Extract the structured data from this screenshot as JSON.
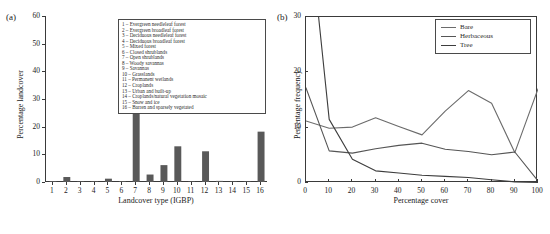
{
  "figure": {
    "panel_a_tag": "(a)",
    "panel_b_tag": "(b)"
  },
  "chart_data": [
    {
      "type": "bar",
      "panel": "(a)",
      "title": "",
      "xlabel": "Landcover type (IGBP)",
      "ylabel": "Percentage landcover",
      "categories": [
        "1",
        "2",
        "3",
        "4",
        "5",
        "6",
        "7",
        "8",
        "9",
        "10",
        "11",
        "12",
        "13",
        "14",
        "15",
        "16"
      ],
      "values": [
        0.3,
        1.8,
        0.05,
        0.05,
        1.2,
        0.3,
        43.5,
        2.7,
        6.1,
        12.9,
        0.1,
        11.1,
        0.4,
        0.1,
        0.1,
        18.2
      ],
      "ylim": [
        0,
        60
      ],
      "yticks": [
        0,
        10,
        20,
        30,
        40,
        50,
        60
      ],
      "bar_color": "#595959",
      "grid": false,
      "legend_position": "upper-right",
      "legend_entries": [
        "1 – Evergreen needleleaf forest",
        "2 – Evergreen broadleaf forest",
        "3 – Deciduous needleleaf forest",
        "4 – Deciduous broadleaf forest",
        "5 – Mixed forest",
        "6 – Closed shrublands",
        "7 – Open shrublands",
        "8 – Woody savannas",
        "9 – Savannas",
        "10 – Grasslands",
        "11 – Permanent wetlands",
        "12 – Croplands",
        "13 – Urban and built-up",
        "14 – Croplands/natural vegetation mosaic",
        "15 – Snow and ice",
        "16 – Barren and sparsely vegetated"
      ]
    },
    {
      "type": "line",
      "panel": "(b)",
      "title": "",
      "xlabel": "Percentage cover",
      "ylabel": "Percentage frequency",
      "x": [
        0,
        10,
        20,
        30,
        40,
        50,
        60,
        70,
        80,
        90,
        100
      ],
      "xlim": [
        0,
        100
      ],
      "ylim": [
        0,
        30
      ],
      "xticks": [
        0,
        10,
        20,
        30,
        40,
        50,
        60,
        70,
        80,
        90,
        100
      ],
      "yticks": [
        0,
        10,
        20,
        30
      ],
      "grid": false,
      "legend_position": "upper-right",
      "series": [
        {
          "name": "Bare",
          "color": "#6b6b6b",
          "values": [
            11.2,
            9.9,
            10.1,
            11.8,
            10.2,
            8.7,
            13.0,
            16.7,
            14.4,
            5.5,
            17.0
          ]
        },
        {
          "name": "Herbaceous",
          "color": "#555555",
          "values": [
            17.2,
            5.8,
            5.4,
            6.2,
            6.8,
            7.2,
            6.1,
            5.7,
            5.1,
            5.6,
            0.4
          ]
        },
        {
          "name": "Tree",
          "color": "#3d3d3d",
          "values": [
            52.0,
            11.5,
            4.3,
            2.2,
            1.8,
            1.4,
            1.2,
            1.0,
            0.6,
            0.2,
            0.1
          ]
        }
      ]
    }
  ]
}
